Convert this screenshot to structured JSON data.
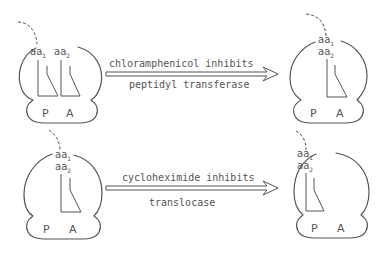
{
  "diagram": {
    "rows": [
      {
        "arrow": {
          "line1": "chloramphenicol inhibits",
          "line2": "peptidyl transferase"
        },
        "left_ribosome": {
          "sites": [
            "P",
            "A"
          ],
          "tRNA_labels": [
            {
              "base": "aa",
              "sub": "1"
            },
            {
              "base": "aa",
              "sub": "2"
            }
          ]
        },
        "right_ribosome": {
          "sites": [
            "P",
            "A"
          ],
          "tRNA_labels": [
            {
              "base": "aa",
              "sub": "1"
            },
            {
              "base": "aa",
              "sub": "2"
            }
          ]
        }
      },
      {
        "arrow": {
          "line1": "cycloheximide inhibits",
          "line2": "translocase"
        },
        "left_ribosome": {
          "sites": [
            "P",
            "A"
          ],
          "tRNA_labels": [
            {
              "base": "aa",
              "sub": "1"
            },
            {
              "base": "aa",
              "sub": "2"
            }
          ]
        },
        "right_ribosome": {
          "sites": [
            "P",
            "A"
          ],
          "tRNA_labels": [
            {
              "base": "aa",
              "sub": "1"
            },
            {
              "base": "aa",
              "sub": "2"
            }
          ]
        }
      }
    ]
  }
}
